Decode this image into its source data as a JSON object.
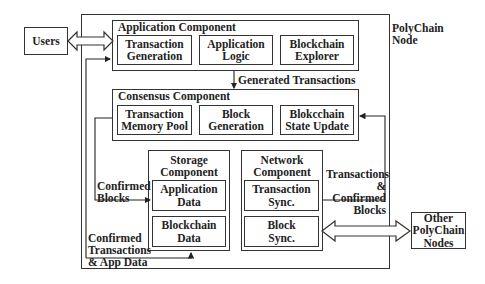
{
  "diagram": {
    "node_label": "PolyChain\nNode",
    "users": "Users",
    "other_nodes": "Other\nPolyChain\nNodes",
    "application": {
      "title": "Application Component",
      "items": [
        "Transaction\nGeneration",
        "Application\nLogic",
        "Blockchain\nExplorer"
      ]
    },
    "consensus": {
      "title": "Consensus Component",
      "items": [
        "Transaction\nMemory Pool",
        "Block\nGeneration",
        "Blokcchain\nState Update"
      ]
    },
    "storage": {
      "title": "Storage\nComponent",
      "items": [
        "Application\nData",
        "Blockchain\nData"
      ]
    },
    "network": {
      "title": "Network\nComponent",
      "items": [
        "Transaction\nSync.",
        "Block\nSync."
      ]
    },
    "edges": {
      "generated_transactions": "Generated Transactions",
      "confirmed_blocks": "Confirmed\nBlocks",
      "confirmed_tx_app_data": "Confirmed\nTransactions\n& App Data",
      "tx_confirmed_blocks": "Transactions\n& Confirmed\nBlocks"
    }
  }
}
